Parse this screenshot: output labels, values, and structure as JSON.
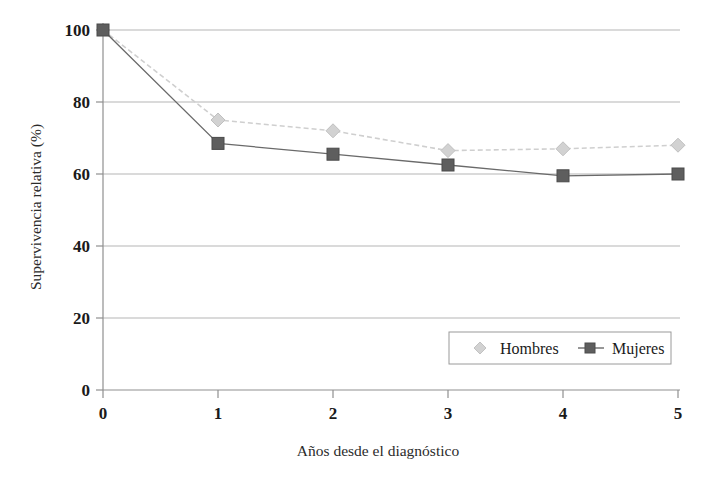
{
  "chart_data": {
    "type": "line",
    "title": "",
    "xlabel": "Años desde el diagnóstico",
    "ylabel": "Supervivencia relativa (%)",
    "x": [
      0,
      1,
      2,
      3,
      4,
      5
    ],
    "xtick_labels": [
      "0",
      "1",
      "2",
      "3",
      "4",
      "5"
    ],
    "ytick_labels": [
      "0",
      "20",
      "40",
      "60",
      "80",
      "100"
    ],
    "yticks": [
      0,
      20,
      40,
      60,
      80,
      100
    ],
    "xlim": [
      0,
      5
    ],
    "ylim": [
      0,
      100
    ],
    "grid": "horizontal",
    "legend_position": "lower-right-inside",
    "series": [
      {
        "name": "Hombres",
        "values": [
          100,
          75,
          72,
          66.5,
          67,
          68
        ],
        "color": "#c9c9c9",
        "marker": "diamond",
        "linestyle": "dashed"
      },
      {
        "name": "Mujeres",
        "values": [
          100,
          68.5,
          65.5,
          62.5,
          59.5,
          60
        ],
        "color": "#5e5e5e",
        "marker": "square",
        "linestyle": "solid"
      }
    ]
  },
  "axes": {
    "x_title": "Años desde el diagnóstico",
    "y_title": "Supervivencia relativa (%)",
    "x_ticks": [
      "0",
      "1",
      "2",
      "3",
      "4",
      "5"
    ],
    "y_ticks": [
      "0",
      "20",
      "40",
      "60",
      "80",
      "100"
    ]
  },
  "legend": {
    "entries": [
      {
        "label": "Hombres",
        "marker": "diamond-marker",
        "color": "#c9c9c9"
      },
      {
        "label": "Mujeres",
        "marker": "square-marker",
        "color": "#5e5e5e"
      }
    ]
  },
  "colors": {
    "hombres": "#c9c9c9",
    "mujeres": "#5e5e5e",
    "gridline": "#b0b0b0",
    "axis": "#8a8a8a",
    "text": "#1a1a1a",
    "background": "#ffffff"
  }
}
